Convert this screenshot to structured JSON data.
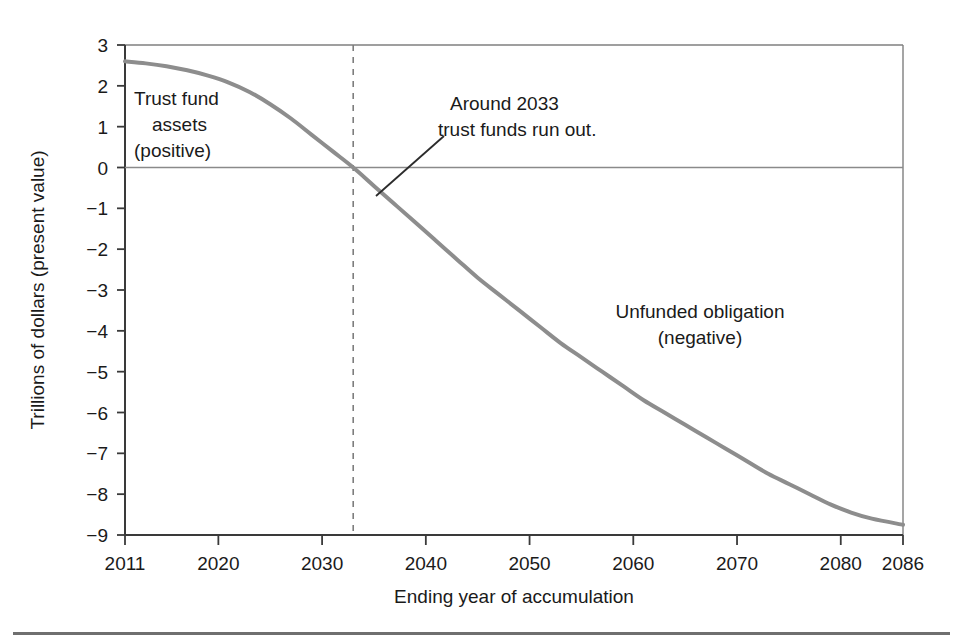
{
  "figure": {
    "background_color": "#ffffff",
    "series_color": "#8d8d8d",
    "axis_color": "#3a3a3a",
    "text_color": "#1a1a1a",
    "rule_color": "#6f6f6f"
  },
  "annotations": {
    "left_label_line1": "Trust fund",
    "left_label_line2": "assets",
    "left_label_line3": "(positive)",
    "callout_line1": "Around 2033",
    "callout_line2": "trust funds run out.",
    "right_label_line1": "Unfunded obligation",
    "right_label_line2": "(negative)"
  },
  "chart_data": {
    "type": "line",
    "title": "",
    "xlabel": "Ending year of accumulation",
    "ylabel": "Trillions of dollars (present value)",
    "xlim": [
      2011,
      2086
    ],
    "ylim": [
      -9,
      3
    ],
    "grid": false,
    "legend": "none",
    "x_tick_labels": [
      "2011",
      "2020",
      "2030",
      "2040",
      "2050",
      "2060",
      "2070",
      "2080",
      "2086"
    ],
    "x_ticks": [
      2011,
      2020,
      2030,
      2040,
      2050,
      2060,
      2070,
      2080,
      2086
    ],
    "y_tick_labels": [
      "3",
      "2",
      "1",
      "0",
      "−1",
      "−2",
      "−3",
      "−4",
      "−5",
      "−6",
      "−7",
      "−8",
      "−9"
    ],
    "y_ticks": [
      3,
      2,
      1,
      0,
      -1,
      -2,
      -3,
      -4,
      -5,
      -6,
      -7,
      -8,
      -9
    ],
    "zero_reference_line": 0,
    "vertical_marker_year": 2033,
    "series": [
      {
        "name": "Cumulative trust fund balance (present value)",
        "x": [
          2011,
          2013,
          2015,
          2017,
          2019,
          2021,
          2023,
          2025,
          2027,
          2029,
          2031,
          2033,
          2035,
          2037,
          2039,
          2041,
          2043,
          2045,
          2047,
          2049,
          2051,
          2053,
          2055,
          2057,
          2059,
          2061,
          2063,
          2065,
          2067,
          2069,
          2071,
          2073,
          2075,
          2077,
          2079,
          2081,
          2083,
          2086
        ],
        "values": [
          2.6,
          2.55,
          2.48,
          2.38,
          2.25,
          2.08,
          1.85,
          1.55,
          1.2,
          0.8,
          0.4,
          0.0,
          -0.45,
          -0.9,
          -1.35,
          -1.8,
          -2.25,
          -2.7,
          -3.1,
          -3.5,
          -3.9,
          -4.3,
          -4.65,
          -5.0,
          -5.35,
          -5.7,
          -6.0,
          -6.3,
          -6.6,
          -6.9,
          -7.2,
          -7.5,
          -7.75,
          -8.0,
          -8.25,
          -8.45,
          -8.6,
          -8.75
        ]
      }
    ]
  }
}
